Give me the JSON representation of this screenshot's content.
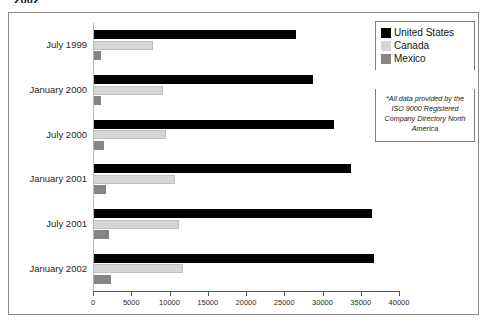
{
  "clipped_header": "2002",
  "legend": {
    "position": "top-right",
    "entries": [
      {
        "label": "United States",
        "color": "#000000",
        "swatch": "us"
      },
      {
        "label": "Canada",
        "color": "#d6d6d6",
        "swatch": "ca"
      },
      {
        "label": "Mexico",
        "color": "#858585",
        "swatch": "mx"
      }
    ]
  },
  "footnote": {
    "text": "*All data provided by the ISO 9000 Registered Company Directory North America"
  },
  "axis": {
    "ticks": [
      "0",
      "5000",
      "10000",
      "15000",
      "20000",
      "25000",
      "30000",
      "35000",
      "40000"
    ]
  },
  "chart_data": {
    "type": "bar",
    "orientation": "horizontal",
    "title": "",
    "xlabel": "",
    "ylabel": "",
    "xlim": [
      0,
      40000
    ],
    "grid": false,
    "legend_position": "top-right",
    "categories": [
      "July 1999",
      "January 2000",
      "July 2000",
      "January 2001",
      "July 2001",
      "January 2002"
    ],
    "tick_values": [
      0,
      5000,
      10000,
      15000,
      20000,
      25000,
      30000,
      35000,
      40000
    ],
    "series": [
      {
        "name": "United States",
        "color": "#000000",
        "values": [
          26500,
          28800,
          31500,
          33700,
          36500,
          36700
        ]
      },
      {
        "name": "Canada",
        "color": "#d6d6d6",
        "values": [
          7800,
          9100,
          9500,
          10700,
          11200,
          11700
        ]
      },
      {
        "name": "Mexico",
        "color": "#858585",
        "values": [
          1000,
          1100,
          1400,
          1700,
          2100,
          2400
        ]
      }
    ],
    "annotations": [
      "*All data provided by the ISO 9000 Registered Company Directory North America"
    ]
  }
}
